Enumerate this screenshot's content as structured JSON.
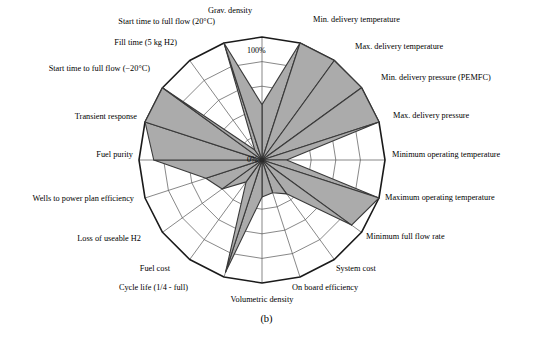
{
  "caption": "(b)",
  "colors": {
    "fill": "#ababab",
    "stroke": "#3a3a3a",
    "grid": "#555555",
    "outline": "#1a1a1a",
    "text": "#000000",
    "background": "#ffffff"
  },
  "ticks": {
    "outer_label": "100%",
    "center_label": "0%"
  },
  "chart_data": {
    "type": "radar",
    "title": "",
    "subtitle": "",
    "xlabel": "",
    "ylabel": "",
    "rlim": [
      0,
      100
    ],
    "rticks": [
      20,
      40,
      60,
      80,
      100
    ],
    "runits": "%",
    "grid": true,
    "legend": "none",
    "series": [
      {
        "name": "Target fulfilment",
        "values": [
          45,
          100,
          100,
          100,
          100,
          20,
          100,
          90,
          34,
          28,
          30,
          96,
          22,
          40,
          48,
          88,
          100,
          100,
          10,
          100
        ]
      }
    ],
    "categories": [
      "Grav. density",
      "Min. delivery temperature",
      "Max. delivery temperature",
      "Min. delivery pressure (PEMFC)",
      "Max. delivery pressure",
      "Minimum operating temperature",
      "Maximum operating temperature",
      "Minimum full flow rate",
      "System cost",
      "On board efficiency",
      "Volumetric density",
      "Cycle life (1/4 - full)",
      "Fuel cost",
      "Loss of useable H2",
      "Wells to power plan efficiency",
      "Fuel purity",
      "Transient response",
      "Start time to full flow (−20°C)",
      "Fill time (5 kg H2)",
      "Start time to full flow (20°C)"
    ],
    "annotations": [
      {
        "text": "100%",
        "role": "outer-ring-tick"
      },
      {
        "text": "0%",
        "role": "center-tick"
      }
    ]
  },
  "axes": [
    {
      "label": "Grav. density",
      "value": 45,
      "angle": 0,
      "label_x": 230,
      "label_y": 12,
      "align": "center"
    },
    {
      "label": "Min. delivery temperature",
      "value": 100,
      "angle": 18,
      "label_x": 313,
      "label_y": 21,
      "align": "left"
    },
    {
      "label": "Max. delivery temperature",
      "value": 100,
      "angle": 36,
      "label_x": 355,
      "label_y": 48,
      "align": "left"
    },
    {
      "label": "Min. delivery pressure (PEMFC)",
      "value": 100,
      "angle": 54,
      "label_x": 381,
      "label_y": 79,
      "align": "left"
    },
    {
      "label": "Max. delivery pressure",
      "value": 100,
      "angle": 72,
      "label_x": 393,
      "label_y": 117,
      "align": "left"
    },
    {
      "label": "Minimum operating temperature",
      "value": 20,
      "angle": 90,
      "label_x": 392,
      "label_y": 156,
      "align": "left"
    },
    {
      "label": "Maximum operating temperature",
      "value": 100,
      "angle": 108,
      "label_x": 385,
      "label_y": 199,
      "align": "left"
    },
    {
      "label": "Minimum full flow rate",
      "value": 90,
      "angle": 126,
      "label_x": 366,
      "label_y": 238,
      "align": "left"
    },
    {
      "label": "System cost",
      "value": 34,
      "angle": 144,
      "label_x": 336,
      "label_y": 270,
      "align": "left"
    },
    {
      "label": "On board efficiency",
      "value": 28,
      "angle": 162,
      "label_x": 292,
      "label_y": 289,
      "align": "left"
    },
    {
      "label": "Volumetric density",
      "value": 30,
      "angle": 180,
      "label_x": 262,
      "label_y": 301,
      "align": "center"
    },
    {
      "label": "Cycle life (1/4 - full)",
      "value": 96,
      "angle": 198,
      "label_x": 188,
      "label_y": 289,
      "align": "right"
    },
    {
      "label": "Fuel cost",
      "value": 22,
      "angle": 216,
      "label_x": 170,
      "label_y": 270,
      "align": "right"
    },
    {
      "label": "Loss of useable H2",
      "value": 40,
      "angle": 234,
      "label_x": 141,
      "label_y": 240,
      "align": "right"
    },
    {
      "label": "Wells to power plan efficiency",
      "value": 48,
      "angle": 252,
      "label_x": 134,
      "label_y": 200,
      "align": "right"
    },
    {
      "label": "Fuel purity",
      "value": 88,
      "angle": 270,
      "label_x": 133,
      "label_y": 156,
      "align": "right"
    },
    {
      "label": "Transient response",
      "value": 100,
      "angle": 288,
      "label_x": 137,
      "label_y": 118,
      "align": "right"
    },
    {
      "label": "Start time to full flow (−20°C)",
      "value": 100,
      "angle": 306,
      "label_x": 150,
      "label_y": 70,
      "align": "right"
    },
    {
      "label": "Fill time (5 kg H2)",
      "value": 10,
      "angle": 324,
      "label_x": 177,
      "label_y": 44,
      "align": "right"
    },
    {
      "label": "Start time to full flow (20°C)",
      "value": 100,
      "angle": 342,
      "label_x": 215,
      "label_y": 23,
      "align": "right"
    }
  ],
  "geometry": {
    "cx": 262,
    "cy": 160,
    "radius": 123,
    "rings": 5
  }
}
